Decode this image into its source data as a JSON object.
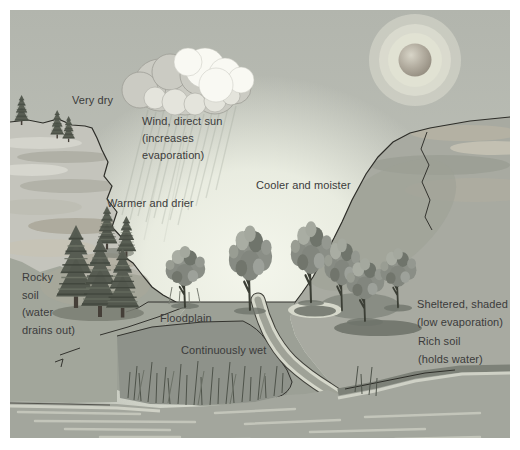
{
  "labels": {
    "very_dry": "Very dry",
    "wind_direct_sun": "Wind, direct sun\n(increases\nevaporation)",
    "warmer_and_drier": "Warmer and drier",
    "cooler_and_moister": "Cooler and moister",
    "rocky_soil": "Rocky\nsoil\n(water\ndrains out)",
    "floodplain": "Floodplain",
    "continuously_wet": "Continuously wet",
    "sheltered_shaded": "Sheltered, shaded\n(low evaporation)",
    "rich_soil": "Rich soil\n(holds water)"
  },
  "palette": {
    "sky": "#b4b7af",
    "valley_light": "#f2f4ea",
    "sun_disk": "#a49d90",
    "sun_glow": "#e4e5d7",
    "cloud_white": "#f9f9f3",
    "cloud_gray": "#cbcbc3",
    "cliff_light": "#c4c4bc",
    "slope_left": "#a2a69b",
    "slope_right": "#a8aaa1",
    "ground": "#9ca096",
    "marsh": "#8e928a",
    "water": "#a3a69d",
    "water_streak": "#c9cbc0",
    "stream_bank": "#d6d8cb",
    "pine_dark": "#565b51",
    "canopy": "#8e928a",
    "outline": "#33332e",
    "text": "#3b3b3b"
  }
}
